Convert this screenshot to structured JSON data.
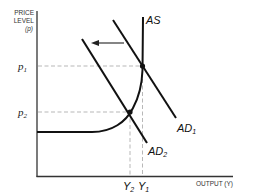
{
  "diagram": {
    "y_axis": {
      "title_line1": "PRICE",
      "title_line2": "LEVEL",
      "title_line3": "(p)"
    },
    "x_axis": {
      "title": "OUTPUT (Y)"
    },
    "price_levels": [
      {
        "label": "p",
        "sub": "1"
      },
      {
        "label": "p",
        "sub": "2"
      }
    ],
    "output_levels": [
      {
        "label": "Y",
        "sub": "2"
      },
      {
        "label": "Y",
        "sub": "1"
      }
    ],
    "curves": {
      "as": {
        "label": "AS"
      },
      "ad1": {
        "label": "AD",
        "sub": "1"
      },
      "ad2": {
        "label": "AD",
        "sub": "2"
      }
    },
    "shift_arrow": {
      "direction": "left"
    },
    "colors": {
      "line": "#111111",
      "dashed": "#999999",
      "background": "#ffffff"
    }
  }
}
